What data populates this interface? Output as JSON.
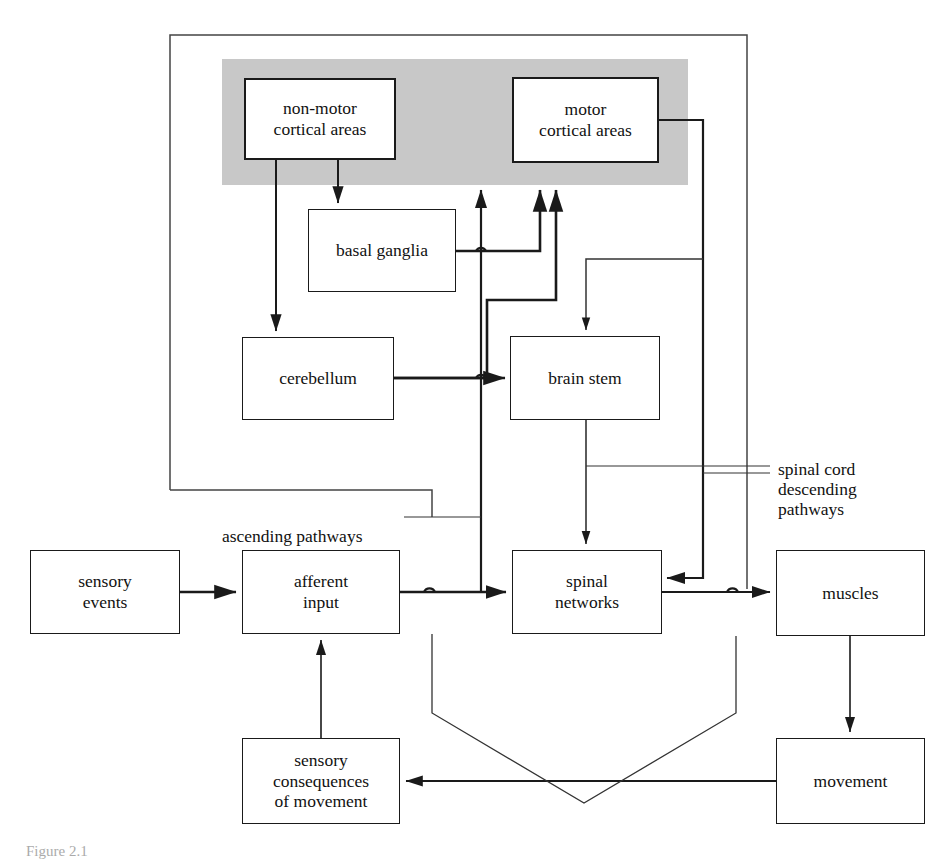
{
  "figure": {
    "caption": "Figure 2.1"
  },
  "regions": {
    "cortex_band_label": "cerebral cortex (shaded band)",
    "outer_frame_label": "brain / supraspinal enclosure"
  },
  "nodes": [
    {
      "id": "non-motor-cortical-areas",
      "label": "non-motor\ncortical areas"
    },
    {
      "id": "motor-cortical-areas",
      "label": "motor\ncortical areas"
    },
    {
      "id": "basal-ganglia",
      "label": "basal ganglia"
    },
    {
      "id": "cerebellum",
      "label": "cerebellum"
    },
    {
      "id": "brain-stem",
      "label": "brain stem"
    },
    {
      "id": "sensory-events",
      "label": "sensory\nevents"
    },
    {
      "id": "afferent-input",
      "label": "afferent\ninput"
    },
    {
      "id": "spinal-networks",
      "label": "spinal\nnetworks"
    },
    {
      "id": "muscles",
      "label": "muscles"
    },
    {
      "id": "sensory-consequences-of-movement",
      "label": "sensory\nconsequences\nof movement"
    },
    {
      "id": "movement",
      "label": "movement"
    }
  ],
  "pathway_labels": {
    "ascending": "ascending pathways",
    "descending": "spinal cord\ndescending\npathways"
  },
  "colors": {
    "cortex_band": "#c8c8c8",
    "line": "#1a1a1a",
    "thin_line": "#333333",
    "background": "#ffffff"
  }
}
